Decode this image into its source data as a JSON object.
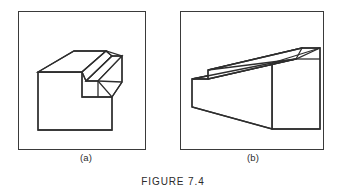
{
  "figure": {
    "caption": "FIGURE 7.4",
    "page_background": "#ffffff",
    "line_color": "#2e2e2e",
    "frame_color": "#3a3a3a"
  },
  "panels": [
    {
      "id": "panel-a",
      "label": "(a)",
      "drawing_name": "isometric-pictorial-block-with-notch",
      "description": "Isometric line drawing of a rectangular block with an angled wedge cut across the top and a stepped notch",
      "frame": {
        "x": 6,
        "y": 11,
        "width": 128,
        "height": 139
      },
      "shape": {
        "type": "isometric-line-drawing",
        "faces": [
          {
            "name": "front-lower-face",
            "points": "4,38 4,96 78,96 78,63 48,63 48,38"
          },
          {
            "name": "top-sloped-wedge-face",
            "points": "4,38 40,17 72,17 48,38"
          },
          {
            "name": "wedge-right-face",
            "points": "72,17 78,22 52,47 48,38"
          },
          {
            "name": "step-top-face",
            "points": "52,47 78,22 88,22 64,47"
          },
          {
            "name": "step-right-face",
            "points": "88,22 88,48 78,63 64,47"
          }
        ],
        "edges": [
          "M4,38 L4,96 L78,96 L78,63",
          "M4,38 L48,38 L48,63 L78,63",
          "M4,38 L40,17 L72,17 L48,38",
          "M72,17 L78,22 L52,47 L48,38",
          "M78,22 L88,22 L88,48 L78,63",
          "M52,47 L64,47 L64,63",
          "M88,22 L78,22",
          "M64,47 L88,48"
        ]
      }
    },
    {
      "id": "panel-b",
      "label": "(b)",
      "drawing_name": "isometric-pictorial-tapered-block",
      "description": "Isometric line drawing of a long tapered wedge block with a raised rib along the top rear edge",
      "frame": {
        "x": 6,
        "y": 11,
        "width": 144,
        "height": 139
      },
      "shape": {
        "type": "isometric-line-drawing",
        "faces": [
          {
            "name": "front-tapered-face",
            "points": "6,56 6,84 86,106 86,40"
          },
          {
            "name": "top-rib-face",
            "points": "22,47 116,25 134,25 54,47"
          },
          {
            "name": "rib-front-face",
            "points": "22,47 22,56 110,36 116,25"
          },
          {
            "name": "top-main-face",
            "points": "6,56 22,56 110,36 86,40"
          },
          {
            "name": "right-end-face",
            "points": "86,40 86,106 134,106 134,25"
          }
        ],
        "edges": [
          "M6,56 L6,84 L86,106 L86,40 Z",
          "M22,47 L116,25 L134,25 L134,106 L86,106",
          "M22,47 L22,56 L6,56",
          "M22,56 L110,36 L116,25",
          "M110,36 L134,36",
          "M86,40 L110,36",
          "M86,40 L134,25",
          "M86,40 L86,106"
        ]
      }
    }
  ]
}
